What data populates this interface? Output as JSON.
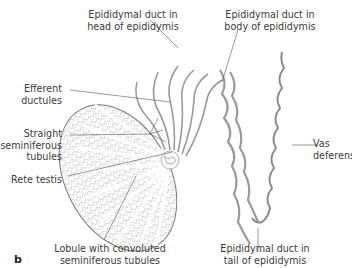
{
  "figure": {
    "panel_letter": "b",
    "labels": {
      "head": [
        "Epididymal duct in",
        "head of epididymis"
      ],
      "body": [
        "Epididymal duct in",
        "body of epididymis"
      ],
      "efferent": [
        "Efferent",
        "ductules"
      ],
      "straight": [
        "Straight",
        "seminiferous",
        "tubules"
      ],
      "rete": [
        "Rete testis"
      ],
      "lobule": [
        "Lobule with convoluted",
        "seminiferous tubules"
      ],
      "vas": [
        "Vas",
        "deferens"
      ],
      "tail": [
        "Epididymal duct in",
        "tail of epididymis"
      ]
    },
    "colors": {
      "line": "#555555",
      "tissue": "#8a8a8a",
      "fill": "#f3f3f3"
    }
  }
}
